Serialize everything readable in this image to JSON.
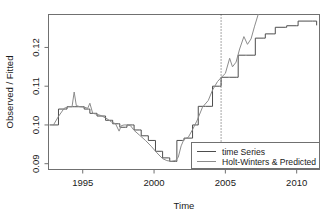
{
  "chart_data": {
    "type": "line",
    "title": "",
    "xlabel": "Time",
    "ylabel": "Observed / Fitted",
    "xlim": [
      1992.6,
      2011.6
    ],
    "ylim": [
      0.0885,
      0.1285
    ],
    "xticks": [
      1995,
      2000,
      2005,
      2010
    ],
    "xticklabels": [
      "1995",
      "2000",
      "2005",
      "2010"
    ],
    "yticks": [
      0.09,
      0.1,
      0.11,
      0.12
    ],
    "yticklabels": [
      "0.09",
      "0.10",
      "0.11",
      "0.12"
    ],
    "grid": false,
    "legend_position": "bottom-right",
    "legend": [
      {
        "label": "time Series",
        "color": "#4d4d4d"
      },
      {
        "label": "Holt-Winters & Predicted",
        "color": "#8c8c8c"
      }
    ],
    "annotations": [
      {
        "type": "vertical-dotted-line",
        "x": 2004.7,
        "label": ""
      }
    ],
    "series": [
      {
        "name": "time Series",
        "color": "#4d4d4d",
        "style": "step",
        "x": [
          1992.7,
          1993.2,
          1993.3,
          1993.8,
          1993.9,
          1994.3,
          1994.4,
          1994.6,
          1994.7,
          1995.0,
          1995.1,
          1995.4,
          1995.5,
          1995.9,
          1996.0,
          1996.5,
          1996.6,
          1997.0,
          1997.1,
          1997.5,
          1997.6,
          1998.0,
          1998.1,
          1998.5,
          1998.6,
          1999.0,
          1999.1,
          1999.5,
          1999.6,
          2000.0,
          2000.1,
          2000.5,
          2000.6,
          2001.0,
          2001.1,
          2001.5,
          2001.6,
          2002.0,
          2002.1,
          2002.6,
          2002.7,
          2003.0,
          2003.1,
          2003.5,
          2003.6,
          2004.0,
          2004.1,
          2004.6,
          2004.7,
          2005.2,
          2005.3,
          2005.8,
          2005.9,
          2006.4,
          2006.5,
          2007.0,
          2007.1,
          2007.7,
          2007.8,
          2008.4,
          2008.5,
          2009.2,
          2009.3,
          2010.0,
          2010.1,
          2011.0,
          2011.1,
          2011.4
        ],
        "y": [
          0.1,
          0.1,
          0.1041,
          0.1041,
          0.1047,
          0.1047,
          0.1047,
          0.1047,
          0.1047,
          0.1047,
          0.1041,
          0.1041,
          0.103,
          0.103,
          0.1023,
          0.1023,
          0.1012,
          0.1012,
          0.1003,
          0.1003,
          0.0994,
          0.0994,
          0.1,
          0.1,
          0.0987,
          0.0987,
          0.0972,
          0.0972,
          0.096,
          0.096,
          0.0932,
          0.0932,
          0.0915,
          0.0915,
          0.0906,
          0.0906,
          0.096,
          0.096,
          0.0966,
          0.0966,
          0.1,
          0.1,
          0.1048,
          0.1048,
          0.1048,
          0.1048,
          0.11,
          0.11,
          0.1123,
          0.1123,
          0.1123,
          0.1123,
          0.118,
          0.118,
          0.118,
          0.118,
          0.1224,
          0.1224,
          0.1235,
          0.1235,
          0.1252,
          0.1252,
          0.1256,
          0.1256,
          0.1268,
          0.1268,
          0.1268,
          0.1258
        ]
      },
      {
        "name": "Holt-Winters & Predicted",
        "color": "#8c8c8c",
        "style": "line",
        "x": [
          1992.95,
          1993.3,
          1993.7,
          1994.0,
          1994.25,
          1994.4,
          1994.55,
          1994.8,
          1995.1,
          1995.35,
          1995.5,
          1995.7,
          1995.95,
          1996.3,
          1996.7,
          1997.0,
          1997.3,
          1997.55,
          1997.7,
          1997.9,
          1998.1,
          1998.35,
          1998.6,
          1999.0,
          1999.4,
          1999.8,
          2000.2,
          2000.6,
          2000.9,
          2001.2,
          2001.5,
          2001.7,
          2001.9,
          2002.1,
          2002.4,
          2002.7,
          2003.0,
          2003.4,
          2003.8,
          2004.1,
          2004.45,
          2004.7,
          2005.0,
          2005.3,
          2005.5,
          2005.75,
          2006.0,
          2006.3,
          2006.55,
          2006.8,
          2007.05,
          2007.3
        ],
        "y": [
          0.1,
          0.1022,
          0.1043,
          0.1047,
          0.1047,
          0.1085,
          0.105,
          0.1047,
          0.1046,
          0.1043,
          0.1056,
          0.103,
          0.1028,
          0.1024,
          0.1016,
          0.1008,
          0.1003,
          0.0984,
          0.0998,
          0.1,
          0.1,
          0.0998,
          0.0986,
          0.0973,
          0.096,
          0.0945,
          0.0928,
          0.0913,
          0.0908,
          0.0906,
          0.0908,
          0.0917,
          0.0946,
          0.0963,
          0.0968,
          0.0988,
          0.101,
          0.1046,
          0.1063,
          0.109,
          0.1112,
          0.1122,
          0.1133,
          0.1172,
          0.115,
          0.1162,
          0.1196,
          0.1228,
          0.1208,
          0.1222,
          0.1255,
          0.1285
        ]
      }
    ]
  },
  "axes": {
    "ylabel": "Observed / Fitted",
    "xlabel": "Time"
  }
}
